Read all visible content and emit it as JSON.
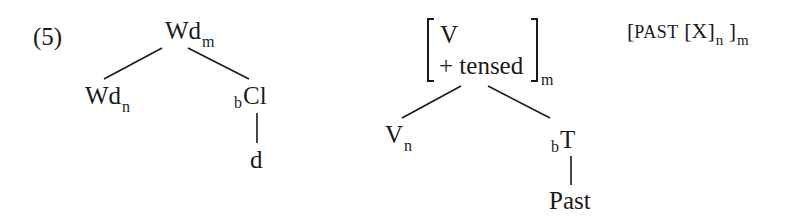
{
  "example_number": "(5)",
  "tree1": {
    "root": {
      "base": "Wd",
      "sub": "m"
    },
    "left_child": {
      "base": "Wd",
      "sub": "n"
    },
    "right_child": {
      "pre": "b",
      "base": "Cl"
    },
    "right_leaf": "d"
  },
  "tree2": {
    "root": {
      "feature1": "V",
      "feature2": "+ tensed",
      "sub": "m"
    },
    "left_child": {
      "base": "V",
      "sub": "n"
    },
    "right_child": {
      "pre": "b",
      "base": "T"
    },
    "right_leaf": "Past"
  },
  "bracketing": {
    "open1": "[",
    "past": "PAST",
    "open2": "[",
    "x": "X",
    "close2": "]",
    "sub_n": "n",
    "close1": "]",
    "sub_m": "m"
  },
  "colors": {
    "ink": "#1a1a1a",
    "background": "#ffffff"
  }
}
